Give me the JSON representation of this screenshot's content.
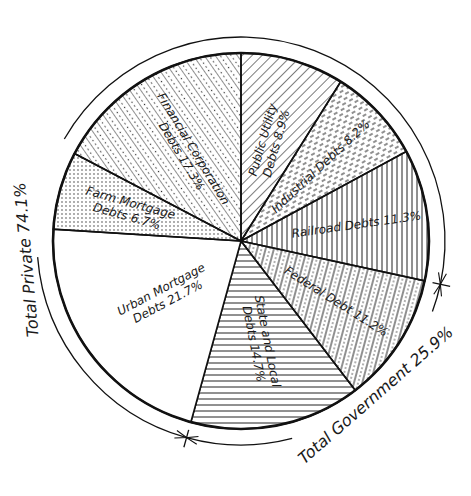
{
  "chart_data": {
    "type": "pie",
    "title": "",
    "start": "top",
    "direction": "clockwise",
    "slices": [
      {
        "name": "Public Utility Debts",
        "value": 8.9,
        "label_lines": [
          "Public Utility",
          "Debts 8.9%"
        ],
        "pattern": "diag-right",
        "group": "private"
      },
      {
        "name": "Industrial Debts",
        "value": 8.2,
        "label_lines": [
          "Industrial Debts 8.2%"
        ],
        "pattern": "dash-diag",
        "group": "private"
      },
      {
        "name": "Railroad Debts",
        "value": 11.3,
        "label_lines": [
          "Railroad Debts 11.3%"
        ],
        "pattern": "vertical",
        "group": "private"
      },
      {
        "name": "Federal Debt",
        "value": 11.2,
        "label_lines": [
          "Federal Debt 11.2%"
        ],
        "pattern": "vert-dots",
        "group": "government"
      },
      {
        "name": "State and Local Debts",
        "value": 14.7,
        "label_lines": [
          "State and Local",
          "Debts 14.7%"
        ],
        "pattern": "horizontal",
        "group": "government"
      },
      {
        "name": "Urban Mortgage Debts",
        "value": 21.7,
        "label_lines": [
          "Urban Mortgage",
          "Debts 21.7%"
        ],
        "pattern": "blank",
        "group": "private"
      },
      {
        "name": "Farm Mortgage Debts",
        "value": 6.7,
        "label_lines": [
          "Farm Mortgage",
          "Debts 6.7%"
        ],
        "pattern": "dots",
        "group": "private"
      },
      {
        "name": "Financial Corporation Debts",
        "value": 17.3,
        "label_lines": [
          "Financial Corporation",
          "Debts 17.3%"
        ],
        "pattern": "diag-left-dots",
        "group": "private"
      }
    ],
    "groups": [
      {
        "name": "Total Private",
        "value": 74.1,
        "label": "Total Private 74.1%"
      },
      {
        "name": "Total Government",
        "value": 25.9,
        "label": "Total Government 25.9%"
      }
    ]
  }
}
